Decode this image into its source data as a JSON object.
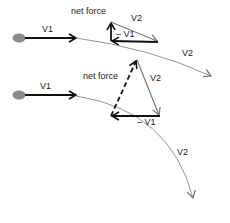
{
  "colors": {
    "ball": "#8a8a8a",
    "v1_arrow": "#111111",
    "v2_arrow": "#7a7a7a",
    "net_force": "#111111",
    "path": "#8a8a8a",
    "text": "#222222"
  },
  "diagrams": [
    {
      "id": "top",
      "labels": {
        "v1": "V1",
        "net_force": "net force",
        "triangle_v2": "V2",
        "minus_v1": "– V1",
        "path_v2": "V2"
      },
      "net_force_style": "solid"
    },
    {
      "id": "bottom",
      "labels": {
        "v1": "V1",
        "net_force": "net force",
        "triangle_v2": "V2",
        "minus_v1": "– V1",
        "path_v2": "V2"
      },
      "net_force_style": "dashed"
    }
  ]
}
